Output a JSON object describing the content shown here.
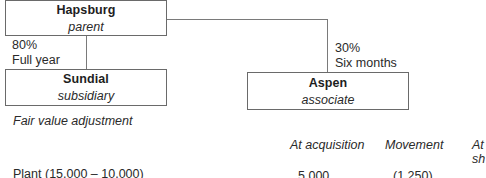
{
  "diagram": {
    "parent": {
      "name": "Hapsburg",
      "role": "parent"
    },
    "subsidiary": {
      "name": "Sundial",
      "role": "subsidiary",
      "holding": "80%",
      "period": "Full year"
    },
    "associate": {
      "name": "Aspen",
      "role": "associate",
      "holding": "30%",
      "period": "Six months"
    }
  },
  "section": {
    "heading": "Fair value adjustment",
    "columns": [
      "At acquisition",
      "Movement",
      "At",
      "sh"
    ],
    "rows": [
      {
        "label": "Plant (15,000 – 10,000)",
        "at_acquisition": "5,000",
        "movement": "(1,250)"
      }
    ]
  },
  "colors": {
    "border": "#6a6a6a",
    "text": "#1e1e1e"
  }
}
